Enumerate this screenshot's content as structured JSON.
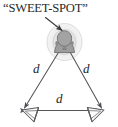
{
  "figure": {
    "name": "stereo-sweet-spot-equilateral-triangle-diagram",
    "width": 118,
    "height": 127,
    "background_color": "#ffffff",
    "ink_color": "#29292b",
    "line_color": "#58585c",
    "ellipse_outer_fill": "#f0f0f0",
    "ellipse_outer_stroke": "#d8d8d8",
    "ellipse_inner_fill": "#e3e3e3",
    "ellipse_inner_stroke": "#cccccc",
    "head_fill": "#9a9a9a",
    "head_stroke": "#6e6e70",
    "speaker_fill": "#ffffff",
    "speaker_stroke": "#5a5a5e"
  },
  "callout": {
    "caption": "“SWEET-SPOT”",
    "leader_line": "arrow pointing from caption to the listening position"
  },
  "distances": {
    "left": "d",
    "right": "d",
    "base": "d"
  },
  "elements": {
    "listener": "listener-head",
    "left_speaker": "loudspeaker",
    "right_speaker": "loudspeaker",
    "sweet_spot_zone": "concentric-ellipse-zone"
  }
}
